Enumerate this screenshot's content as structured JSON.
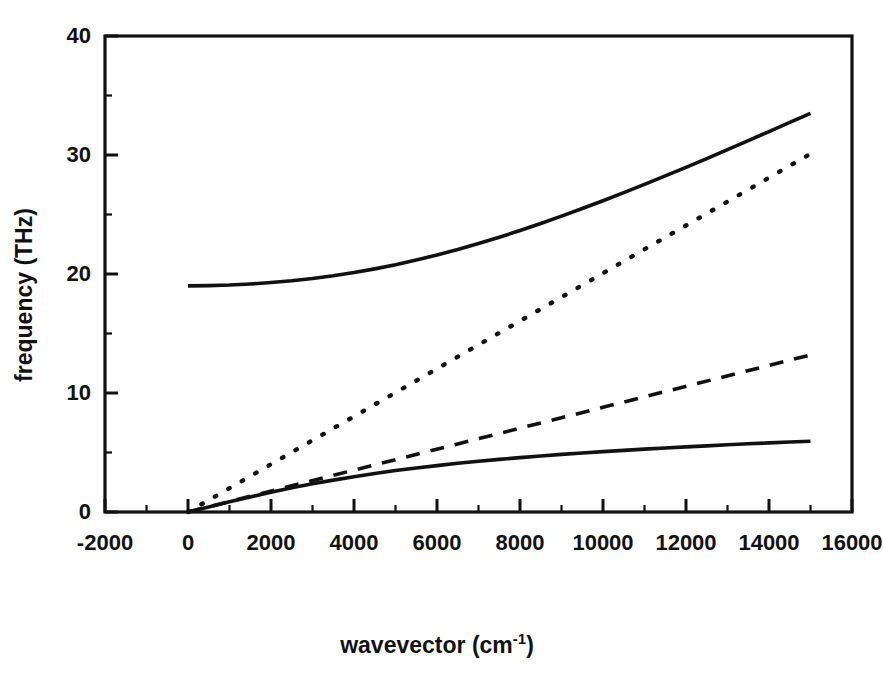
{
  "chart_data": {
    "type": "line",
    "title": "",
    "xlabel": "wavevector (cm",
    "xlabel_sup": "-1",
    "xlabel_tail": ")",
    "ylabel": "frequency (THz)",
    "xlim": [
      -2000,
      16000
    ],
    "ylim": [
      0,
      40
    ],
    "grid": false,
    "legend": "none",
    "xticks": [
      -2000,
      0,
      2000,
      4000,
      6000,
      8000,
      10000,
      12000,
      14000,
      16000
    ],
    "xtick_labels": [
      "-2000",
      "0",
      "2000",
      "4000",
      "6000",
      "8000",
      "10000",
      "12000",
      "14000",
      "16000"
    ],
    "xminor_step": 1000,
    "yticks": [
      0,
      10,
      20,
      30,
      40
    ],
    "ytick_labels": [
      "0",
      "10",
      "20",
      "30",
      "40"
    ],
    "yminor_step": 5,
    "series": [
      {
        "name": "upper polariton branch",
        "style": "solid",
        "x": [
          0,
          500,
          1000,
          1500,
          2000,
          2500,
          3000,
          3500,
          4000,
          4500,
          5000,
          5500,
          6000,
          6500,
          7000,
          7500,
          8000,
          8500,
          9000,
          9500,
          10000,
          10500,
          11000,
          11500,
          12000,
          12500,
          13000,
          13500,
          14000,
          14500,
          15000
        ],
        "y": [
          19.0,
          19.02,
          19.07,
          19.16,
          19.28,
          19.43,
          19.62,
          19.85,
          20.12,
          20.43,
          20.78,
          21.17,
          21.6,
          22.06,
          22.56,
          23.09,
          23.65,
          24.24,
          24.86,
          25.5,
          26.16,
          26.84,
          27.53,
          28.24,
          28.96,
          29.7,
          30.45,
          31.2,
          31.97,
          32.74,
          33.5
        ]
      },
      {
        "name": "photon light line (vacuum)",
        "style": "dotted",
        "x": [
          0,
          15000
        ],
        "y": [
          0,
          30.1
        ]
      },
      {
        "name": "photon line in medium",
        "style": "dashed",
        "x": [
          0,
          15000
        ],
        "y": [
          0,
          13.2
        ]
      },
      {
        "name": "lower polariton branch",
        "style": "solid",
        "x": [
          0,
          500,
          1000,
          1500,
          2000,
          2500,
          3000,
          3500,
          4000,
          4500,
          5000,
          5500,
          6000,
          6500,
          7000,
          7500,
          8000,
          8500,
          9000,
          9500,
          10000,
          10500,
          11000,
          11500,
          12000,
          12500,
          13000,
          13500,
          14000,
          14500,
          15000
        ],
        "y": [
          0.0,
          0.43,
          0.86,
          1.27,
          1.66,
          2.03,
          2.37,
          2.68,
          2.97,
          3.24,
          3.48,
          3.7,
          3.9,
          4.09,
          4.26,
          4.42,
          4.57,
          4.71,
          4.84,
          4.96,
          5.07,
          5.18,
          5.28,
          5.38,
          5.47,
          5.56,
          5.65,
          5.73,
          5.81,
          5.88,
          5.95
        ]
      }
    ],
    "annotations": [
      {
        "text": "upper branch starts at approximately 19 THz at zero wavevector"
      },
      {
        "text": "upper branch reaches approximately 37.6 THz at 15000 cm-1"
      },
      {
        "text": "dotted line reaches approximately 30 THz at 15000 cm-1"
      },
      {
        "text": "dashed line reaches approximately 13.2 THz at 15000 cm-1"
      },
      {
        "text": "lower branch saturates near 6.5 THz"
      }
    ],
    "colors": {
      "line": "#111111",
      "axis": "#111111",
      "background": "#ffffff"
    }
  }
}
